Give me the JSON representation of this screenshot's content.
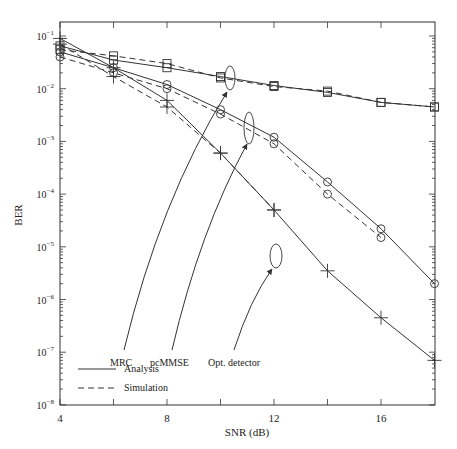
{
  "chart_data": {
    "type": "line",
    "title": "",
    "xlabel": "SNR (dB)",
    "ylabel": "BER",
    "yscale": "log",
    "xlim": [
      4,
      18
    ],
    "ylim": [
      1e-08,
      0.1
    ],
    "grid": false,
    "x_ticks": [
      "4",
      "8",
      "12",
      "16"
    ],
    "y_ticks": [
      "10^-1",
      "10^-2",
      "10^-3",
      "10^-4",
      "10^-5",
      "10^-6",
      "10^-7",
      "10^-8"
    ],
    "x": [
      4,
      6,
      8,
      10,
      12,
      14,
      16,
      18
    ],
    "series": [
      {
        "name": "MRC (Analysis)",
        "marker": "square",
        "style": "solid",
        "values": [
          0.065,
          0.035,
          0.025,
          0.017,
          0.0115,
          0.0085,
          0.0055,
          0.0045
        ]
      },
      {
        "name": "MRC (Simulation)",
        "marker": "square",
        "style": "dashed",
        "values": [
          0.055,
          0.042,
          0.03,
          0.016,
          0.011,
          0.009,
          0.0055,
          0.0045
        ]
      },
      {
        "name": "pcMMSE (Analysis)",
        "marker": "circle",
        "style": "solid",
        "values": [
          0.05,
          0.025,
          0.012,
          0.004,
          0.0012,
          0.00017,
          2.2e-05,
          2e-06
        ]
      },
      {
        "name": "pcMMSE (Simulation)",
        "marker": "circle",
        "style": "dashed",
        "values": [
          0.04,
          0.02,
          0.01,
          0.0033,
          0.0009,
          0.0001,
          1.5e-05,
          null
        ]
      },
      {
        "name": "Opt. detector (Analysis)",
        "marker": "plus",
        "style": "solid",
        "values": [
          0.09,
          0.025,
          0.006,
          0.0006,
          5e-05,
          3.5e-06,
          4.5e-07,
          7e-08
        ]
      },
      {
        "name": "Opt. detector (Simulation)",
        "marker": "plus",
        "style": "dashed",
        "values": [
          0.07,
          0.017,
          0.0045,
          0.0006,
          5e-05,
          null,
          null,
          null
        ]
      }
    ],
    "legend": [
      {
        "label": "Analysis",
        "style": "solid"
      },
      {
        "label": "Simulation",
        "style": "dashed"
      }
    ],
    "legend_position": "lower left",
    "annotations": [
      "MRC",
      "pcMMSE",
      "Opt. detector"
    ]
  },
  "labels": {
    "xlabel": "SNR (dB)",
    "ylabel": "BER",
    "xticks": [
      "4",
      "8",
      "12",
      "16"
    ],
    "legend_analysis": "Analysis",
    "legend_simulation": "Simulation",
    "ann_mrc": "MRC",
    "ann_pcmmse": "pcMMSE",
    "ann_opt": "Opt. detector"
  }
}
